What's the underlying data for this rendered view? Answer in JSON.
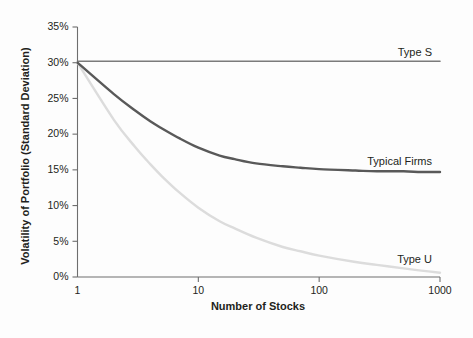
{
  "chart_data": {
    "type": "line",
    "title": "",
    "xlabel": "Number of Stocks",
    "ylabel": "Volatility of Portfolio (Standard Deviation)",
    "xscale": "log",
    "xlim": [
      1,
      1000
    ],
    "ylim": [
      0,
      35
    ],
    "grid": false,
    "legend_position": "inline-right-end-of-series",
    "xticks": [
      1,
      10,
      100,
      1000
    ],
    "xtick_labels": [
      "1",
      "10",
      "100",
      "1000"
    ],
    "yticks": [
      0,
      5,
      10,
      15,
      20,
      25,
      30,
      35
    ],
    "ytick_labels": [
      "0%",
      "5%",
      "10%",
      "15%",
      "20%",
      "25%",
      "30%",
      "35%"
    ],
    "series": [
      {
        "name": "Type S",
        "label": "Type S",
        "color": "#7b7b7b",
        "linewidth": 1.6,
        "x": [
          1,
          2,
          3,
          5,
          10,
          20,
          30,
          50,
          100,
          200,
          300,
          500,
          1000
        ],
        "values": [
          30.2,
          30.2,
          30.2,
          30.2,
          30.2,
          30.2,
          30.2,
          30.2,
          30.2,
          30.2,
          30.2,
          30.2,
          30.2
        ]
      },
      {
        "name": "Typical Firms",
        "label": "Typical Firms",
        "color": "#595959",
        "linewidth": 2.4,
        "x": [
          1,
          2,
          3,
          4,
          5,
          7,
          10,
          15,
          20,
          30,
          50,
          70,
          100,
          200,
          300,
          500,
          700,
          1000
        ],
        "values": [
          30.0,
          25.6,
          23.3,
          21.8,
          20.8,
          19.4,
          18.1,
          17.0,
          16.5,
          15.9,
          15.5,
          15.3,
          15.1,
          14.9,
          14.8,
          14.8,
          14.7,
          14.7
        ]
      },
      {
        "name": "Type U",
        "label": "Type U",
        "color": "#dcdcdc",
        "linewidth": 2.4,
        "x": [
          1,
          2,
          3,
          4,
          5,
          7,
          10,
          15,
          20,
          30,
          50,
          70,
          100,
          200,
          300,
          500,
          700,
          1000
        ],
        "values": [
          30.0,
          22.0,
          18.2,
          15.8,
          14.1,
          11.8,
          9.7,
          7.8,
          6.8,
          5.5,
          4.2,
          3.6,
          3.0,
          2.1,
          1.7,
          1.2,
          0.9,
          0.6
        ]
      }
    ],
    "series_label_anchors": [
      {
        "name": "Type S",
        "x_px": 432,
        "y_px": 56
      },
      {
        "name": "Typical Firms",
        "x_px": 432,
        "y_px": 165
      },
      {
        "name": "Type U",
        "x_px": 432,
        "y_px": 263
      }
    ]
  },
  "colors": {
    "background": "#fdfdfd",
    "axis": "#6e6e6e",
    "text": "#231f20",
    "type_s": "#7b7b7b",
    "typical_firms": "#595959",
    "type_u": "#dcdcdc"
  }
}
